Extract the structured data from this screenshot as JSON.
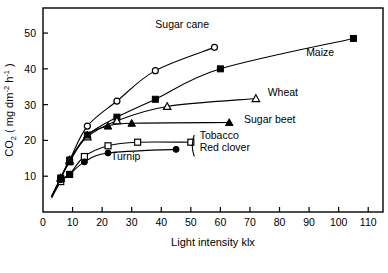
{
  "chart_data": {
    "type": "line",
    "title": "",
    "xlabel": "Light intensity klx",
    "ylabel_parts": {
      "base": "CO",
      "subscript": "2",
      "units_open": " ( mg dm",
      "units_sup1": "-2",
      "units_mid": " h",
      "units_sup2": "-1",
      "units_close": " )"
    },
    "ylabel": "CO2 ( mg dm-2 h-1 )",
    "xlim": [
      0,
      115
    ],
    "ylim": [
      0,
      57
    ],
    "xticks": [
      0,
      10,
      20,
      30,
      40,
      50,
      60,
      70,
      80,
      90,
      100,
      110
    ],
    "yticks": [
      10,
      20,
      30,
      40,
      50
    ],
    "xtick_labels": [
      "0",
      "10",
      "20",
      "30",
      "40",
      "50",
      "60",
      "70",
      "80",
      "90",
      "100",
      "110"
    ],
    "ytick_labels": [
      "10",
      "20",
      "30",
      "40",
      "50"
    ],
    "grid": false,
    "legend": "inline-labels",
    "frame": "box",
    "series": [
      {
        "name": "Sugar cane",
        "label": "Sugar cane",
        "marker": "open-circle",
        "label_x": 38,
        "label_y": 51.5,
        "x": [
          3,
          6,
          9,
          15,
          25,
          38,
          58
        ],
        "y": [
          4.5,
          9.5,
          14.5,
          24.0,
          31.0,
          39.5,
          46.0
        ]
      },
      {
        "name": "Maize",
        "label": "Maize",
        "marker": "filled-square",
        "label_x": 89,
        "label_y": 43.5,
        "x": [
          3,
          6,
          9,
          15,
          25,
          38,
          60,
          105
        ],
        "y": [
          4.5,
          9.5,
          14.5,
          21.5,
          26.5,
          31.5,
          40.0,
          48.5
        ]
      },
      {
        "name": "Wheat",
        "label": "Wheat",
        "marker": "open-triangle",
        "label_x": 76,
        "label_y": 32.5,
        "x": [
          3,
          6,
          9,
          15,
          25,
          42,
          72
        ],
        "y": [
          4.5,
          9.5,
          14.5,
          21.0,
          25.5,
          29.5,
          31.7
        ]
      },
      {
        "name": "Sugar beet",
        "label": "Sugar beet",
        "marker": "filled-triangle",
        "label_x": 68,
        "label_y": 25.0,
        "x": [
          3,
          6,
          9,
          15,
          22,
          30,
          63
        ],
        "y": [
          4.5,
          9.5,
          14.0,
          21.5,
          24.0,
          24.8,
          25.0
        ]
      },
      {
        "name": "Tobacco",
        "label": "Tobacco",
        "marker": "open-square",
        "label_x": 53,
        "label_y": 20.5,
        "x": [
          3,
          6,
          9,
          14,
          22,
          32,
          50
        ],
        "y": [
          4.0,
          8.5,
          10.5,
          15.5,
          18.5,
          19.5,
          19.5
        ]
      },
      {
        "name": "Red clover",
        "label": "Red clover",
        "marker": "filled-circle",
        "label_x": 53,
        "label_y": 17.0,
        "x": [
          3,
          6,
          9,
          14,
          22,
          45
        ],
        "y": [
          4.5,
          9.0,
          10.5,
          14.0,
          16.5,
          17.5
        ]
      },
      {
        "name": "Turnip",
        "label": "Turnip",
        "marker": "none",
        "label_x": 23,
        "label_y": 14.5,
        "x": [],
        "y": []
      }
    ],
    "bracket_labels": [
      "Tobacco",
      "Red clover"
    ]
  }
}
